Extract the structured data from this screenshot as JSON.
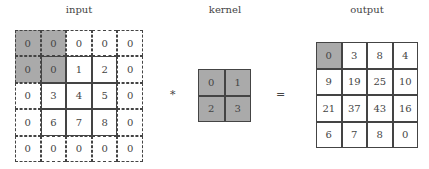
{
  "titles": {
    "input": "input",
    "kernel": "kernel",
    "output": "output"
  },
  "operators": {
    "conv": "*",
    "equals": "="
  },
  "colors": {
    "shade": "#aaaaaa",
    "line": "#444444"
  },
  "input": {
    "rows": [
      [
        "0",
        "0",
        "0",
        "0",
        "0"
      ],
      [
        "0",
        "0",
        "1",
        "2",
        "0"
      ],
      [
        "0",
        "3",
        "4",
        "5",
        "0"
      ],
      [
        "0",
        "6",
        "7",
        "8",
        "0"
      ],
      [
        "0",
        "0",
        "0",
        "0",
        "0"
      ]
    ]
  },
  "kernel": {
    "rows": [
      [
        "0",
        "1"
      ],
      [
        "2",
        "3"
      ]
    ]
  },
  "output": {
    "rows": [
      [
        "0",
        "3",
        "8",
        "4"
      ],
      [
        "9",
        "19",
        "25",
        "10"
      ],
      [
        "21",
        "37",
        "43",
        "16"
      ],
      [
        "6",
        "7",
        "8",
        "0"
      ]
    ]
  }
}
